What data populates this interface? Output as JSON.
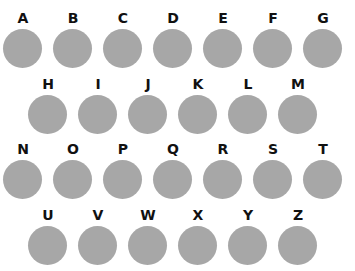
{
  "circle_color": "#a7a7a7",
  "rows": [
    [
      "A",
      "B",
      "C",
      "D",
      "E",
      "F",
      "G"
    ],
    [
      "H",
      "I",
      "J",
      "K",
      "L",
      "M"
    ],
    [
      "N",
      "O",
      "P",
      "Q",
      "R",
      "S",
      "T"
    ],
    [
      "U",
      "V",
      "W",
      "X",
      "Y",
      "Z"
    ]
  ]
}
